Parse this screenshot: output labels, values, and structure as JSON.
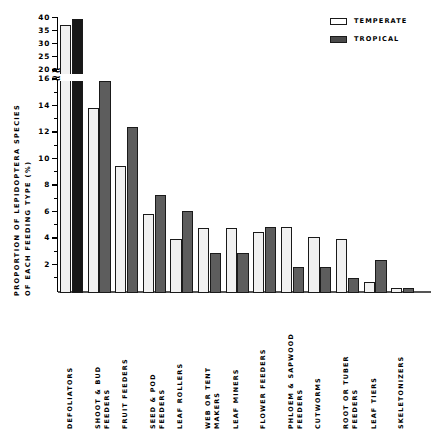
{
  "chart_data": {
    "type": "bar",
    "title": "",
    "xlabel": "",
    "ylabel": "PROPORTION OF LEPIDOPTERA SPECIES OF EACH FEEDING TYPE (%)",
    "ylabel_line1": "PROPORTION OF LEPIDOPTERA SPECIES",
    "ylabel_line2": "OF EACH FEEDING TYPE (%)",
    "grid": false,
    "legend_position": "top-right",
    "axis_break": true,
    "ylim_lower": [
      0,
      16
    ],
    "ylim_upper": [
      20,
      40
    ],
    "yticks_lower": [
      2,
      4,
      6,
      8,
      10,
      12,
      14,
      16
    ],
    "yticks_upper": [
      20,
      25,
      30,
      35,
      40
    ],
    "categories": [
      "DEFOLIATORS",
      "SHOOT & BUD FEEDERS",
      "FRUIT FEEDERS",
      "SEED & POD FEEDERS",
      "LEAF ROLLERS",
      "WEB OR TENT MAKERS",
      "LEAF MINERS",
      "FLOWER FEEDERS",
      "PHLOEM & SAPWOOD FEEDERS",
      "CUTWORMS",
      "ROOT OR TUBER FEEDERS",
      "LEAF TIERS",
      "SKELETONIZERS"
    ],
    "category_lines": [
      [
        "DEFOLIATORS"
      ],
      [
        "SHOOT & BUD",
        "FEEDERS"
      ],
      [
        "FRUIT FEEDERS"
      ],
      [
        "SEED & POD",
        "FEEDERS"
      ],
      [
        "LEAF ROLLERS"
      ],
      [
        "WEB OR TENT",
        "MAKERS"
      ],
      [
        "LEAF MINERS"
      ],
      [
        "FLOWER FEEDERS"
      ],
      [
        "PHLOEM & SAPWOOD",
        "FEEDERS"
      ],
      [
        "CUTWORMS"
      ],
      [
        "ROOT OR TUBER",
        "FEEDERS"
      ],
      [
        "LEAF TIERS"
      ],
      [
        "SKELETONIZERS"
      ]
    ],
    "series": [
      {
        "name": "TEMPERATE",
        "color": "#f1f1f1",
        "values": [
          37.0,
          14.0,
          9.6,
          6.0,
          4.1,
          4.9,
          4.9,
          4.6,
          5.0,
          4.2,
          4.1,
          0.8,
          0.4
        ]
      },
      {
        "name": "TROPICAL",
        "color": "#5d5d5d",
        "values": [
          39.5,
          16.0,
          12.5,
          7.4,
          6.2,
          3.0,
          3.0,
          5.0,
          2.0,
          2.0,
          1.1,
          2.5,
          0.4
        ]
      }
    ]
  },
  "legend": {
    "items": [
      {
        "label": "TEMPERATE",
        "swatch": "temperate"
      },
      {
        "label": "TROPICAL",
        "swatch": "tropical"
      }
    ]
  },
  "yaxis": {
    "ticklabels_lower": [
      "16",
      "14",
      "12",
      "10",
      "8",
      "6",
      "4",
      "2"
    ],
    "ticklabels_upper": [
      "40",
      "35",
      "30",
      "25",
      "20"
    ],
    "break_symbol": "≈"
  }
}
